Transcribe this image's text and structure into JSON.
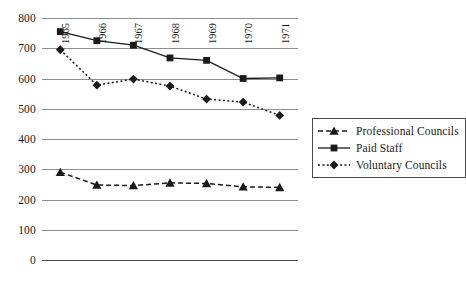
{
  "chart_data": {
    "type": "line",
    "title": "",
    "subtitle": "",
    "xlabel": "",
    "ylabel": "",
    "categories": [
      "1965",
      "1966",
      "1967",
      "1968",
      "1969",
      "1970",
      "1971"
    ],
    "x_tick_labels": [
      "1965",
      "1966",
      "1967",
      "1968",
      "1969",
      "1970",
      "1971"
    ],
    "x_tick_rotation": -90,
    "y_tick_labels": [
      "0",
      "100",
      "200",
      "300",
      "400",
      "500",
      "600",
      "700",
      "800"
    ],
    "y_ticks": [
      0,
      100,
      200,
      300,
      400,
      500,
      600,
      700,
      800
    ],
    "ylim": [
      0,
      800
    ],
    "grid": "horizontal",
    "legend_position": "right",
    "series": [
      {
        "name": "Professional Councils",
        "marker": "triangle",
        "linestyle": "dashed",
        "color": "#1a1a1a",
        "values": [
          290,
          248,
          246,
          255,
          253,
          242,
          240
        ]
      },
      {
        "name": "Paid Staff",
        "marker": "square",
        "linestyle": "solid",
        "color": "#1a1a1a",
        "values": [
          755,
          725,
          710,
          668,
          660,
          600,
          602
        ]
      },
      {
        "name": "Voluntary Councils",
        "marker": "diamond",
        "linestyle": "dotted",
        "color": "#1a1a1a",
        "values": [
          695,
          578,
          598,
          575,
          532,
          522,
          478
        ]
      }
    ]
  },
  "legend": {
    "entries": [
      {
        "label": "Professional Councils"
      },
      {
        "label": "Paid Staff"
      },
      {
        "label": "Voluntary Councils"
      }
    ]
  },
  "colors": {
    "ink": "#1a1a1a",
    "grid": "#8d8d8d",
    "axis": "#4a4a4a",
    "background": "#ffffff"
  }
}
